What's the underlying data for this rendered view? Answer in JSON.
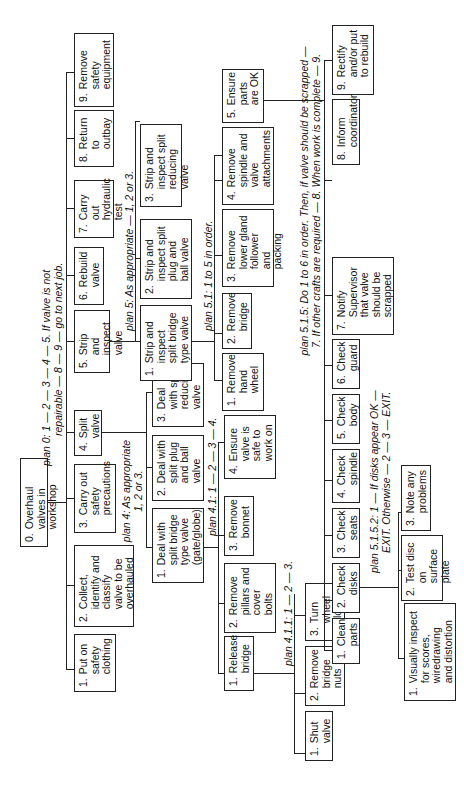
{
  "diagram": {
    "root": {
      "num": "0.",
      "label": "Overhaul valves in workshop"
    },
    "plans": {
      "plan0_line1": "plan 0: 1 — 2 — 3 — 4 — 5. If valve is not",
      "plan0_line2": "repairable — 8 — 9 — go to next job.",
      "plan4_line1": "plan 4: As appropriate",
      "plan4_line2": "1, 2 or 3.",
      "plan5": "plan 5: As appropriate — 1, 2 or 3.",
      "plan41": "plan 4.1: 1 — 2 — 3 — 4.",
      "plan411": "plan 4.1.1: 1 — 2 — 3.",
      "plan51": "plan 5.1: 1 to 5 in order.",
      "plan515_line1": "plan 5.1.5: Do 1 to 6 in order. Then, if valve should be scrapped —",
      "plan515_line2": "7. If other crafts are required — 8. When work is complete — 9.",
      "plan5152_line1": "plan 5.1.5.2: 1 — If disks appear OK —",
      "plan5152_line2": "EXIT. Otherwise — 2 — 3 — EXIT."
    },
    "level1": [
      {
        "num": "1.",
        "label": "Put on safety clothing"
      },
      {
        "num": "2.",
        "label": "Collect, identify and classify valve to be overhauled"
      },
      {
        "num": "3.",
        "label": "Carry out safety precautions"
      },
      {
        "num": "4.",
        "label": "Split valve"
      },
      {
        "num": "5.",
        "label": "Strip and inspect valve"
      },
      {
        "num": "6.",
        "label": "Rebuild valve"
      },
      {
        "num": "7.",
        "label": "Carry out hydraulic test"
      },
      {
        "num": "8.",
        "label": "Return to outbay"
      },
      {
        "num": "9.",
        "label": "Remove safety equipment"
      }
    ],
    "split_valve": [
      {
        "num": "1.",
        "label": "Deal with split bridge type valve (gate/globe)"
      },
      {
        "num": "2.",
        "label": "Deal with split plug and ball valve"
      },
      {
        "num": "3.",
        "label": "Deal with split reducing valve"
      }
    ],
    "strip_inspect": [
      {
        "num": "1.",
        "label": "Strip and inspect split bridge type valve"
      },
      {
        "num": "2.",
        "label": "Strip and inspect split plug and ball valve"
      },
      {
        "num": "3.",
        "label": "Strip and inspect split reducing valve"
      }
    ],
    "deal_bridge": [
      {
        "num": "1.",
        "label": "Release bridge"
      },
      {
        "num": "2.",
        "label": "Remove pillars and cover bolts"
      },
      {
        "num": "3.",
        "label": "Remove bonnet"
      },
      {
        "num": "4.",
        "label": "Ensure valve is safe to work on"
      }
    ],
    "release_bridge": [
      {
        "num": "1.",
        "label": "Shut valve"
      },
      {
        "num": "2.",
        "label": "Remove bridge nuts"
      },
      {
        "num": "3.",
        "label": "Turn wheel clockwise"
      }
    ],
    "strip_bridge": [
      {
        "num": "1.",
        "label": "Remove hand wheel"
      },
      {
        "num": "2.",
        "label": "Remove bridge"
      },
      {
        "num": "3.",
        "label": "Remove lower gland follower and packing"
      },
      {
        "num": "4.",
        "label": "Remove spindle and valve attachments"
      },
      {
        "num": "5.",
        "label": "Ensure parts are OK"
      }
    ],
    "ensure_parts": [
      {
        "num": "1.",
        "label": "Clean parts"
      },
      {
        "num": "2.",
        "label": "Check disks"
      },
      {
        "num": "3.",
        "label": "Check seats"
      },
      {
        "num": "4.",
        "label": "Check spindle"
      },
      {
        "num": "5.",
        "label": "Check body"
      },
      {
        "num": "6.",
        "label": "Check guard"
      },
      {
        "num": "7.",
        "label": "Notify Supervisor that valve should be scrapped"
      },
      {
        "num": "8.",
        "label": "Inform coordinator"
      },
      {
        "num": "9.",
        "label": "Rectify and/or put to rebuild"
      }
    ],
    "check_disks": [
      {
        "num": "1.",
        "label": "Visually inspect for scores, wiredrawing and distortion"
      },
      {
        "num": "2.",
        "label": "Test disc on surface plate"
      },
      {
        "num": "3.",
        "label": "Note any problems"
      }
    ]
  }
}
